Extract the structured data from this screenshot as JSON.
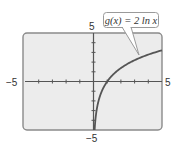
{
  "chart_data": {
    "type": "line",
    "title": "",
    "xlabel": "",
    "ylabel": "",
    "xlim": [
      -5,
      5
    ],
    "ylim": [
      -5,
      5
    ],
    "x_tick_step": 1,
    "y_tick_step": 1,
    "grid": false,
    "axis_labels": {
      "x_min": "−5",
      "x_max": "5",
      "y_min": "−5",
      "y_max": "5"
    },
    "series": [
      {
        "name": "g(x) = 2 ln x",
        "function": "2*ln(x)",
        "x_domain": [
          0.082,
          5
        ],
        "x": [
          0.082,
          0.1,
          0.15,
          0.2,
          0.3,
          0.4,
          0.5,
          0.7,
          1,
          1.5,
          2,
          2.5,
          3,
          3.5,
          4,
          4.5,
          5
        ],
        "values": [
          -5.0,
          -4.61,
          -3.79,
          -3.22,
          -2.41,
          -1.83,
          -1.39,
          -0.71,
          0,
          0.81,
          1.39,
          1.83,
          2.2,
          2.51,
          2.77,
          3.01,
          3.22
        ]
      }
    ],
    "annotations": [
      {
        "text": "g(x) = 2 ln x",
        "points_to_x": 3.5,
        "placement": "top-right"
      }
    ],
    "colors": {
      "panel_fill": "#ececec",
      "panel_border": "#8a8a8a",
      "axis": "#555555",
      "curve": "#555555",
      "callout_border": "#9a9a9a"
    }
  }
}
